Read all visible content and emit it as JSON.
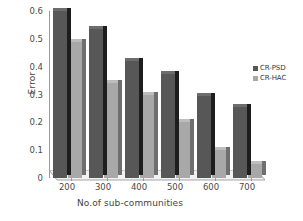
{
  "chart_data": {
    "type": "bar",
    "title": "",
    "xlabel": "No.of sub-communities",
    "ylabel": "Error",
    "categories": [
      "200",
      "300",
      "400",
      "500",
      "600",
      "700"
    ],
    "series": [
      {
        "name": "CR-PSD",
        "color": "#575757",
        "values": [
          0.6,
          0.535,
          0.42,
          0.375,
          0.295,
          0.255
        ]
      },
      {
        "name": "CR-HAC",
        "color": "#a8a8a8",
        "values": [
          0.49,
          0.34,
          0.3,
          0.2,
          0.1,
          0.05
        ]
      }
    ],
    "ylim": [
      0,
      0.6
    ],
    "yticks": [
      "0",
      "0.1",
      "0.2",
      "0.3",
      "0.4",
      "0.5",
      "0.6"
    ],
    "ytick_values": [
      0,
      0.1,
      0.2,
      0.3,
      0.4,
      0.5,
      0.6
    ],
    "grid": false,
    "legend_position": "right",
    "style": "3d-column"
  }
}
